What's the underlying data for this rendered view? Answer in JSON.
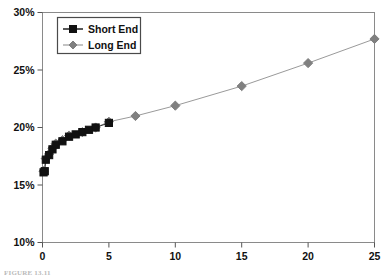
{
  "figure": {
    "caption": "FIGURE 13.11",
    "background_color": "#ffffff"
  },
  "axes": {
    "y_ticks": [
      "30%",
      "25%",
      "20%",
      "15%",
      "10%"
    ],
    "x_ticks": [
      "0",
      "5",
      "10",
      "15",
      "20",
      "25"
    ],
    "frame_color": "#808080",
    "tick_color": "#111111"
  },
  "legend": {
    "position": "top-left-inside",
    "border_color": "#555555",
    "entries": [
      {
        "label": "Short End",
        "marker": "square",
        "color": "#111111",
        "line_color": "#111111"
      },
      {
        "label": "Long End",
        "marker": "diamond",
        "color": "#808080",
        "line_color": "#999999"
      }
    ]
  },
  "chart_data": {
    "type": "scatter",
    "title": "",
    "xlabel": "",
    "ylabel": "",
    "xlim": [
      0,
      25
    ],
    "ylim": [
      10,
      30
    ],
    "y_tick_values": [
      30,
      25,
      20,
      15,
      10
    ],
    "x_tick_values": [
      0,
      5,
      10,
      15,
      20,
      25
    ],
    "y_unit": "percent",
    "grid": false,
    "legend_position": "upper left",
    "series": [
      {
        "name": "Short End",
        "marker": "square",
        "color": "#111111",
        "x": [
          0.08,
          0.17,
          0.25,
          0.5,
          0.75,
          1.0,
          1.5,
          2.0,
          2.5,
          3.0,
          3.5,
          4.0,
          5.0
        ],
        "y": [
          16.1,
          16.2,
          17.2,
          17.6,
          18.1,
          18.5,
          18.8,
          19.2,
          19.4,
          19.6,
          19.8,
          20.0,
          20.4
        ]
      },
      {
        "name": "Long End",
        "marker": "diamond",
        "color": "#808080",
        "x": [
          0.08,
          0.25,
          0.5,
          0.75,
          1.0,
          1.5,
          2.0,
          3.0,
          4.0,
          5.0,
          7.0,
          10.0,
          15.0,
          20.0,
          25.0
        ],
        "y": [
          16.2,
          17.3,
          17.7,
          18.2,
          18.6,
          18.9,
          19.3,
          19.6,
          20.0,
          20.5,
          21.0,
          21.9,
          23.6,
          25.6,
          27.7
        ]
      }
    ]
  }
}
